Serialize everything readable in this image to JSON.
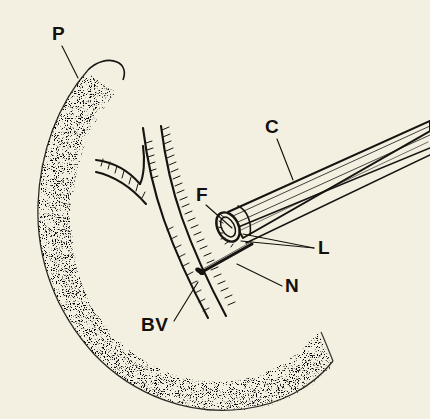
{
  "figure": {
    "background_color": "#f3f0e2",
    "ink_color": "#161310",
    "width": 430,
    "height": 419,
    "style": "pen-and-ink line drawing with stipple shading"
  },
  "labels": [
    {
      "key": "P",
      "text": "P",
      "meaning": "pancreas",
      "x": 52,
      "y": 40,
      "leader_from": [
        62,
        46
      ],
      "leader_to": [
        78,
        78
      ]
    },
    {
      "key": "C",
      "text": "C",
      "meaning": "cannula",
      "x": 265,
      "y": 133,
      "leader_from": [
        277,
        139
      ],
      "leader_to": [
        293,
        180
      ]
    },
    {
      "key": "F",
      "text": "F",
      "meaning": "flange",
      "x": 196,
      "y": 201,
      "leader_from": [
        206,
        205
      ],
      "leader_to": [
        232,
        228
      ]
    },
    {
      "key": "L",
      "text": "L",
      "meaning": "lumen",
      "x": 318,
      "y": 254,
      "leader_from": [
        314,
        248
      ],
      "leader_to": [
        243,
        234
      ]
    },
    {
      "key": "N",
      "text": "N",
      "meaning": "needle",
      "x": 285,
      "y": 292,
      "leader_from": [
        282,
        286
      ],
      "leader_to": [
        237,
        264
      ]
    },
    {
      "key": "BV",
      "text": "BV",
      "meaning": "blood vessel",
      "x": 141,
      "y": 331,
      "leader_from": [
        174,
        321
      ],
      "leader_to": [
        198,
        282
      ]
    }
  ],
  "structures": {
    "pancreas": {
      "name": "pancreas",
      "label_key": "P",
      "rendering": "stippled crescent outline"
    },
    "blood_vessel": {
      "name": "blood vessel",
      "label_key": "BV",
      "rendering": "hatched tubular vessel with Y bifurcation"
    },
    "cannula": {
      "name": "cannula",
      "label_key": "C",
      "rendering": "tapered open tube running to upper right"
    },
    "lumen": {
      "name": "lumen",
      "label_key": "L",
      "rendering": "elliptical bore at cannula mouth"
    },
    "flange": {
      "name": "flange",
      "label_key": "F",
      "rendering": "rim at cannula tip"
    },
    "needle": {
      "name": "needle",
      "label_key": "N",
      "rendering": "fine shaft entering vessel wall"
    }
  }
}
